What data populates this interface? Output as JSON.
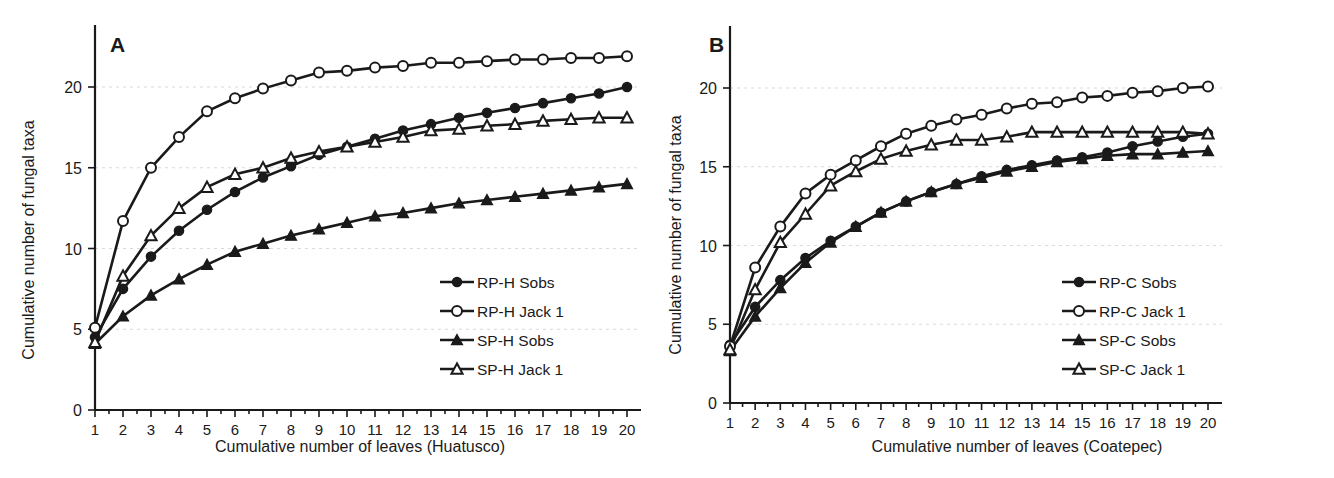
{
  "figure": {
    "panels": [
      "A",
      "B"
    ],
    "shared_ylabel": "Cumulative number of fungal taxa"
  },
  "panelA": {
    "letter": "A",
    "xlabel": "Cumulative number of leaves (Huatusco)",
    "ylabel": "Cumulative number of fungal taxa",
    "xticks": [
      "1",
      "2",
      "3",
      "4",
      "5",
      "6",
      "7",
      "8",
      "9",
      "10",
      "11",
      "12",
      "13",
      "14",
      "15",
      "16",
      "17",
      "18",
      "19",
      "20"
    ],
    "yticks": [
      "0",
      "5",
      "10",
      "15",
      "20"
    ],
    "legend": [
      {
        "label": "RP-H Sobs",
        "marker": "filled-circle"
      },
      {
        "label": "RP-H Jack 1",
        "marker": "open-circle"
      },
      {
        "label": "SP-H Sobs",
        "marker": "filled-triangle"
      },
      {
        "label": "SP-H Jack 1",
        "marker": "open-triangle"
      }
    ]
  },
  "panelB": {
    "letter": "B",
    "xlabel": "Cumulative number of leaves (Coatepec)",
    "ylabel": "Cumulative number of fungal taxa",
    "xticks": [
      "1",
      "2",
      "3",
      "4",
      "5",
      "6",
      "7",
      "8",
      "9",
      "10",
      "11",
      "12",
      "13",
      "14",
      "15",
      "16",
      "17",
      "18",
      "19",
      "20"
    ],
    "yticks": [
      "0",
      "5",
      "10",
      "15",
      "20"
    ],
    "legend": [
      {
        "label": "RP-C Sobs",
        "marker": "filled-circle"
      },
      {
        "label": "RP-C Jack 1",
        "marker": "open-circle"
      },
      {
        "label": "SP-C Sobs",
        "marker": "filled-triangle"
      },
      {
        "label": "SP-C Jack 1",
        "marker": "open-triangle"
      }
    ]
  },
  "chart_data": [
    {
      "type": "line",
      "panel": "A",
      "title": "A",
      "xlabel": "Cumulative number of leaves (Huatusco)",
      "ylabel": "Cumulative number of fungal taxa",
      "x": [
        1,
        2,
        3,
        4,
        5,
        6,
        7,
        8,
        9,
        10,
        11,
        12,
        13,
        14,
        15,
        16,
        17,
        18,
        19,
        20
      ],
      "xlim": [
        1,
        20
      ],
      "ylim": [
        0,
        23
      ],
      "yticks": [
        0,
        5,
        10,
        15,
        20
      ],
      "grid": "horizontal-dotted",
      "legend_position": "right-middle",
      "series": [
        {
          "name": "RP-H Sobs",
          "marker": "filled-circle",
          "values": [
            4.5,
            7.5,
            9.5,
            11.1,
            12.4,
            13.5,
            14.4,
            15.1,
            15.8,
            16.3,
            16.8,
            17.3,
            17.7,
            18.1,
            18.4,
            18.7,
            19.0,
            19.3,
            19.6,
            20.0
          ]
        },
        {
          "name": "RP-H Jack 1",
          "marker": "open-circle",
          "values": [
            5.1,
            11.7,
            15.0,
            16.9,
            18.5,
            19.3,
            19.9,
            20.4,
            20.9,
            21.0,
            21.2,
            21.3,
            21.5,
            21.5,
            21.6,
            21.7,
            21.7,
            21.8,
            21.8,
            21.9
          ]
        },
        {
          "name": "SP-H Sobs",
          "marker": "filled-triangle",
          "values": [
            4.1,
            5.8,
            7.1,
            8.1,
            9.0,
            9.8,
            10.3,
            10.8,
            11.2,
            11.6,
            12.0,
            12.2,
            12.5,
            12.8,
            13.0,
            13.2,
            13.4,
            13.6,
            13.8,
            14.0
          ]
        },
        {
          "name": "SP-H Jack 1",
          "marker": "open-triangle",
          "values": [
            4.2,
            8.3,
            10.8,
            12.5,
            13.8,
            14.6,
            15.0,
            15.6,
            16.0,
            16.3,
            16.6,
            16.9,
            17.3,
            17.4,
            17.6,
            17.7,
            17.9,
            18.0,
            18.1,
            18.1
          ]
        }
      ]
    },
    {
      "type": "line",
      "panel": "B",
      "title": "B",
      "xlabel": "Cumulative number of leaves (Coatepec)",
      "ylabel": "Cumulative number of fungal taxa",
      "x": [
        1,
        2,
        3,
        4,
        5,
        6,
        7,
        8,
        9,
        10,
        11,
        12,
        13,
        14,
        15,
        16,
        17,
        18,
        19,
        20
      ],
      "xlim": [
        1,
        20
      ],
      "ylim": [
        0,
        23
      ],
      "yticks": [
        0,
        5,
        10,
        15,
        20
      ],
      "grid": "horizontal-dotted",
      "legend_position": "right-middle",
      "series": [
        {
          "name": "RP-C Sobs",
          "marker": "filled-circle",
          "values": [
            3.7,
            6.1,
            7.8,
            9.2,
            10.3,
            11.2,
            12.1,
            12.8,
            13.4,
            13.9,
            14.4,
            14.8,
            15.1,
            15.4,
            15.6,
            15.9,
            16.3,
            16.6,
            16.9,
            17.1
          ]
        },
        {
          "name": "RP-C Jack 1",
          "marker": "open-circle",
          "values": [
            3.6,
            8.6,
            11.2,
            13.3,
            14.5,
            15.4,
            16.3,
            17.1,
            17.6,
            18.0,
            18.3,
            18.7,
            19.0,
            19.1,
            19.4,
            19.5,
            19.7,
            19.8,
            20.0,
            20.1
          ]
        },
        {
          "name": "SP-C Sobs",
          "marker": "filled-triangle",
          "values": [
            3.3,
            5.5,
            7.3,
            8.9,
            10.2,
            11.2,
            12.1,
            12.8,
            13.4,
            13.9,
            14.3,
            14.7,
            15.0,
            15.3,
            15.5,
            15.7,
            15.8,
            15.8,
            15.9,
            16.0
          ]
        },
        {
          "name": "SP-C Jack 1",
          "marker": "open-triangle",
          "values": [
            3.4,
            7.2,
            10.2,
            12.0,
            13.8,
            14.7,
            15.5,
            16.0,
            16.4,
            16.7,
            16.7,
            16.9,
            17.2,
            17.2,
            17.2,
            17.2,
            17.2,
            17.2,
            17.2,
            17.1
          ]
        }
      ]
    }
  ]
}
